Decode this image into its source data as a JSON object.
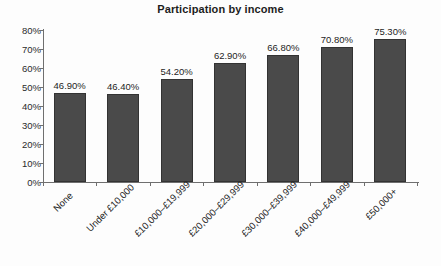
{
  "chart_data": {
    "type": "bar",
    "title": "Participation by income",
    "xlabel": "",
    "ylabel": "",
    "ylim": [
      0,
      80
    ],
    "grid": false,
    "legend": false,
    "categories": [
      "None",
      "Under £10,000",
      "£10,000–£19,999",
      "£20,000–£29,999",
      "£30,000–£39,999",
      "£40,000–£49,999",
      "£50,000+"
    ],
    "values": [
      46.9,
      46.4,
      54.2,
      62.9,
      66.8,
      70.8,
      75.3
    ],
    "data_labels": [
      "46.90%",
      "46.40%",
      "54.20%",
      "62.90%",
      "66.80%",
      "70.80%",
      "75.30%"
    ],
    "ytick_labels": [
      "0%",
      "10%",
      "20%",
      "30%",
      "40%",
      "50%",
      "60%",
      "70%",
      "80%"
    ],
    "ytick_values": [
      0,
      10,
      20,
      30,
      40,
      50,
      60,
      70,
      80
    ],
    "bar_color": "#4a4a4a",
    "bar_border_color": "#333333",
    "axis_color": "#6f6f6f",
    "text_color": "#1d1d1d",
    "background_color": "#fdfdfd"
  }
}
